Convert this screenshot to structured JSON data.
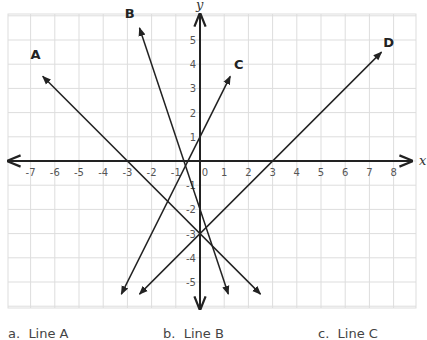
{
  "chart_data": {
    "type": "line",
    "title": "",
    "xlabel": "x",
    "ylabel": "y",
    "xlim": [
      -8,
      8.5
    ],
    "ylim": [
      -6,
      6
    ],
    "grid": true,
    "x_ticks": [
      -7,
      -6,
      -5,
      -4,
      -3,
      -2,
      -1,
      0,
      1,
      2,
      3,
      4,
      5,
      6,
      7,
      8
    ],
    "y_ticks": [
      -5,
      -4,
      -3,
      -2,
      -1,
      1,
      2,
      3,
      4,
      5
    ],
    "series": [
      {
        "name": "A",
        "equation": "y = -x - 3",
        "start": [
          2.5,
          -5.5
        ],
        "end": [
          -6.5,
          3.5
        ],
        "label_at": [
          -6.8,
          4.2
        ]
      },
      {
        "name": "B",
        "equation": "y = -3x - 2",
        "start": [
          1.17,
          -5.5
        ],
        "end": [
          -2.5,
          5.5
        ],
        "label_at": [
          -2.9,
          5.9
        ]
      },
      {
        "name": "C",
        "equation": "y = 2x + 1",
        "start": [
          -3.25,
          -5.5
        ],
        "end": [
          1.25,
          3.5
        ],
        "label_at": [
          1.6,
          3.8
        ]
      },
      {
        "name": "D",
        "equation": "y = x - 3",
        "start": [
          -2.5,
          -5.5
        ],
        "end": [
          7.5,
          4.5
        ],
        "label_at": [
          7.8,
          4.7
        ]
      }
    ]
  },
  "choices": [
    {
      "letter": "a.",
      "label": "Line A"
    },
    {
      "letter": "b.",
      "label": "Line B"
    },
    {
      "letter": "c.",
      "label": "Line C"
    }
  ]
}
